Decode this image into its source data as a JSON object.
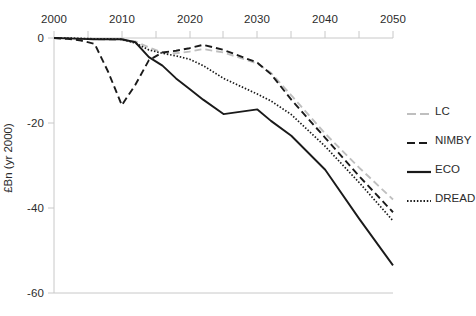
{
  "chart_data": {
    "type": "line",
    "title": "",
    "subtitle": "",
    "xlabel": "",
    "ylabel": "£Bn (yr 2000)",
    "xlim": [
      2000,
      2050
    ],
    "ylim": [
      -60,
      0
    ],
    "xticks": [
      2000,
      2010,
      2020,
      2030,
      2040,
      2050
    ],
    "xtick_labels": [
      "2000",
      "2010",
      "2020",
      "2030",
      "2040",
      "2050"
    ],
    "yticks": [
      0,
      -20,
      -40,
      -60
    ],
    "ytick_labels": [
      "0",
      "-20",
      "-40",
      "-60"
    ],
    "grid": false,
    "legend_position": "right",
    "x": [
      2000,
      2002,
      2004,
      2006,
      2008,
      2010,
      2012,
      2014,
      2016,
      2018,
      2020,
      2022,
      2025,
      2030,
      2032,
      2035,
      2040,
      2045,
      2050
    ],
    "series": [
      {
        "name": "LC",
        "style": "dashed",
        "color": "#bfbfbf",
        "values": [
          0,
          0,
          -0.2,
          -0.3,
          -0.4,
          -0.5,
          -0.8,
          -2.2,
          -3.4,
          -3.6,
          -3.2,
          -2.6,
          -3.4,
          -6.0,
          -8.2,
          -13.5,
          -22.5,
          -30.5,
          -38.0
        ]
      },
      {
        "name": "NIMBY",
        "style": "dashed",
        "color": "#1a1a1a",
        "values": [
          0,
          -0.2,
          -0.6,
          -1.4,
          -8.0,
          -15.8,
          -11.0,
          -5.2,
          -3.4,
          -3.0,
          -2.4,
          -1.6,
          -2.8,
          -5.8,
          -8.5,
          -14.5,
          -23.5,
          -32.5,
          -41.0
        ]
      },
      {
        "name": "ECO",
        "style": "solid",
        "color": "#1a1a1a",
        "values": [
          0,
          -0.1,
          -0.2,
          -0.3,
          -0.3,
          -0.3,
          -1.0,
          -4.5,
          -6.5,
          -9.5,
          -12.0,
          -14.5,
          -17.9,
          -16.8,
          -19.5,
          -23.0,
          -31.0,
          -42.5,
          -53.5
        ]
      },
      {
        "name": "DREAD",
        "style": "dotted",
        "color": "#1a1a1a",
        "values": [
          0,
          0,
          -0.1,
          -0.2,
          -0.2,
          -0.3,
          -1.2,
          -2.8,
          -3.6,
          -4.2,
          -5.0,
          -6.5,
          -9.5,
          -13.2,
          -14.8,
          -18.0,
          -25.5,
          -34.0,
          -43.0
        ]
      }
    ],
    "legend": [
      {
        "label": "LC",
        "style": "dashed",
        "color": "#bfbfbf"
      },
      {
        "label": "NIMBY",
        "style": "dashed",
        "color": "#1a1a1a"
      },
      {
        "label": "ECO",
        "style": "solid",
        "color": "#1a1a1a"
      },
      {
        "label": "DREAD",
        "style": "dotted",
        "color": "#1a1a1a"
      }
    ],
    "axis_color": "#c8c8c8"
  }
}
